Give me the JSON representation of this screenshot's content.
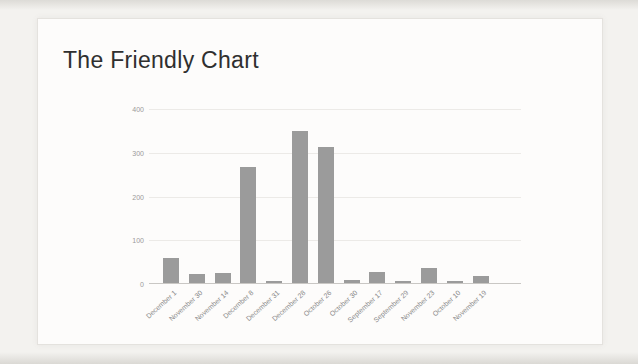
{
  "page": {
    "title": "The Friendly Chart"
  },
  "chart_data": {
    "type": "bar",
    "title": "The Friendly Chart",
    "categories": [
      "December 1",
      "November 30",
      "November 14",
      "December 8",
      "December 31",
      "December 28",
      "October 26",
      "October 30",
      "September 17",
      "September 29",
      "November 23",
      "October 10",
      "November 19"
    ],
    "values": [
      57,
      20,
      24,
      265,
      5,
      348,
      310,
      6,
      25,
      5,
      34,
      5,
      15
    ],
    "xlabel": "",
    "ylabel": "",
    "ylim": [
      0,
      400
    ],
    "yticks": [
      0,
      100,
      200,
      300,
      400
    ],
    "grid": true,
    "legend": "none",
    "bar_color": "#9b9b9b"
  },
  "colors": {
    "background": "#f3f2ef",
    "card": "#fdfcfb",
    "card_border": "#e4e2de",
    "title": "#2f2f2f",
    "gridline": "#eceae7",
    "axis_line": "#c9c7c4",
    "tick": "#9a9a9a",
    "label": "#8a8a8a",
    "bar": "#9b9b9b"
  }
}
